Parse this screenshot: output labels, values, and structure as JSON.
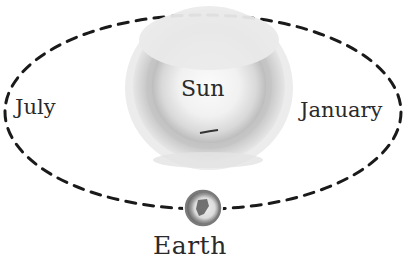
{
  "diagram": {
    "type": "orbit",
    "labels": {
      "sun": "Sun",
      "earth": "Earth",
      "left_position": "July",
      "right_position": "January"
    },
    "colors": {
      "orbit_line": "#1a1a1a",
      "sun_outer": "#d6d6d6",
      "sun_ring": "#b8b8b8",
      "sun_core": "#f4f4f4",
      "earth_ring": "#8a8a8a",
      "earth_core": "#6e6e6e",
      "text": "#2a2a2a",
      "background": "#ffffff"
    }
  }
}
